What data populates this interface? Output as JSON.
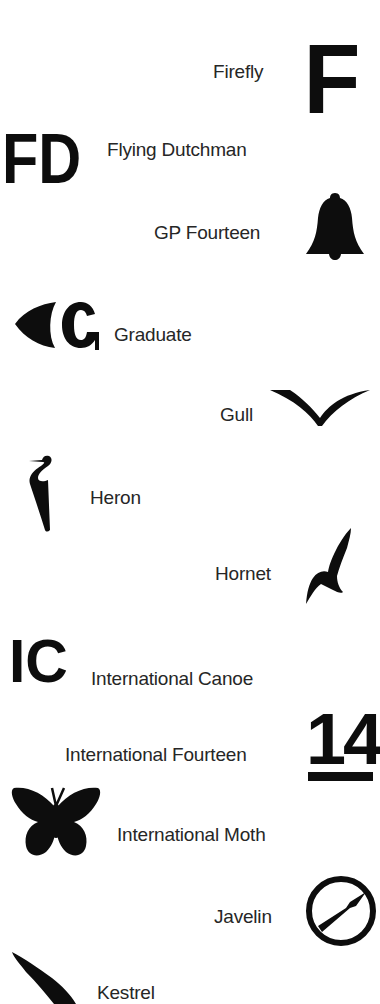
{
  "entries": [
    {
      "name": "Firefly",
      "symbol": "letter-F"
    },
    {
      "name": "Flying Dutchman",
      "symbol": "letters-FD"
    },
    {
      "name": "GP Fourteen",
      "symbol": "bell-icon"
    },
    {
      "name": "Graduate",
      "symbol": "arrowhead-C"
    },
    {
      "name": "Gull",
      "symbol": "gull-wings-icon"
    },
    {
      "name": "Heron",
      "symbol": "heron-icon"
    },
    {
      "name": "Hornet",
      "symbol": "bird-silhouette-icon"
    },
    {
      "name": "International Canoe",
      "symbol": "letters-IC"
    },
    {
      "name": "International Fourteen",
      "symbol": "underlined-14"
    },
    {
      "name": "International Moth",
      "symbol": "butterfly-icon"
    },
    {
      "name": "Javelin",
      "symbol": "circle-javelin-icon"
    },
    {
      "name": "Kestrel",
      "symbol": "kestrel-wing-icon"
    }
  ],
  "symbols": {
    "firefly": "F",
    "flying_dutchman": "FD",
    "international_canoe": "IC",
    "international_fourteen": "14"
  },
  "colors": {
    "ink": "#0d0d0d",
    "background": "#ffffff"
  }
}
